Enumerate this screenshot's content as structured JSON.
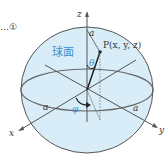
{
  "diagram": {
    "equation_ref": "…①",
    "sphere_label": "球面",
    "point_label": "P(x, y, z)",
    "axes": {
      "x": "x",
      "y": "y",
      "z": "z"
    },
    "radius_labels": [
      "a",
      "a",
      "a"
    ],
    "angle_theta": "θ",
    "angle_phi": "φ",
    "colors": {
      "sphere_fill": "#d8edf7",
      "outline": "#555555",
      "accent": "#3a8fd0"
    }
  }
}
